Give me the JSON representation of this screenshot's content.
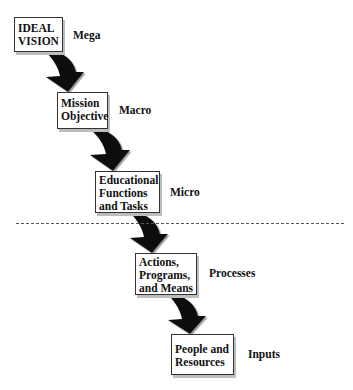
{
  "diagram": {
    "type": "cascade",
    "steps": [
      {
        "label_lines": [
          "IDEAL",
          "VISION"
        ],
        "level": "Mega"
      },
      {
        "label_lines": [
          "Mission",
          "Objective"
        ],
        "level": "Macro"
      },
      {
        "label_lines": [
          "Educational",
          "Functions",
          "and Tasks"
        ],
        "level": "Micro"
      },
      {
        "label_lines": [
          "Actions,",
          "Programs,",
          "and Means"
        ],
        "level": "Processes"
      },
      {
        "label_lines": [
          "People and",
          "Resources"
        ],
        "level": "Inputs"
      }
    ],
    "divider": "dashed line between Micro and Processes"
  }
}
